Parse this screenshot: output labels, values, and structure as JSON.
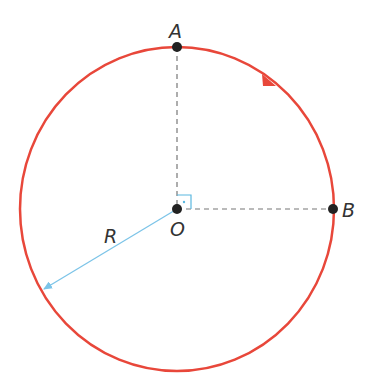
{
  "diagram": {
    "labels": {
      "A": "A",
      "B": "B",
      "O": "O",
      "R": "R"
    },
    "colors": {
      "circle": "#e8473a",
      "dashed": "#777777",
      "radius_arrow": "#7cc4e8",
      "right_angle": "#5bb8e0",
      "points": "#222222"
    },
    "geometry": {
      "center": [
        177,
        209
      ],
      "rx": 157,
      "ry": 162,
      "point_A": [
        177,
        47
      ],
      "point_B": [
        333,
        209
      ],
      "direction": "clockwise"
    }
  }
}
